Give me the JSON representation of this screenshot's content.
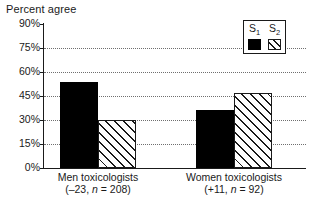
{
  "chart_data": {
    "type": "bar",
    "title": "Percent agree",
    "xlabel": "",
    "ylabel": "",
    "ylim": [
      0,
      90
    ],
    "yticks": [
      "0%",
      "15%",
      "30%",
      "45%",
      "60%",
      "75%",
      "90%"
    ],
    "ytick_values": [
      0,
      15,
      30,
      45,
      60,
      75,
      90
    ],
    "grid": true,
    "legend_position": "top-right",
    "categories": [
      "Men toxicologists",
      "Women toxicologists"
    ],
    "category_sublabels": [
      "(–23, n = 208)",
      "(+11, n = 92)"
    ],
    "category_lines": [
      {
        "line1": "Men toxicologists",
        "delta": "(–23, ",
        "n_italic": "n",
        "n_rest": " = 208)"
      },
      {
        "line1": "Women toxicologists",
        "delta": "(+11, ",
        "n_italic": "n",
        "n_rest": " = 92)"
      }
    ],
    "series": [
      {
        "name": "S₁",
        "label_base": "S",
        "label_sub": "1",
        "fill": "solid-black",
        "color": "#000000",
        "values": [
          54,
          36
        ]
      },
      {
        "name": "S₂",
        "label_base": "S",
        "label_sub": "2",
        "fill": "diagonal-hatch",
        "color": "#1a1a1a",
        "values": [
          30,
          47
        ]
      }
    ]
  },
  "legend": {
    "entries": [
      {
        "base": "S",
        "sub": "1"
      },
      {
        "base": "S",
        "sub": "2"
      }
    ]
  }
}
